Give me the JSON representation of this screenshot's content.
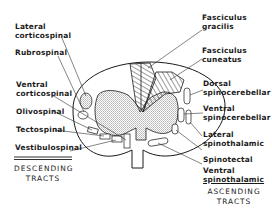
{
  "diagram": {
    "type": "spinal-cord-cross-section",
    "descending": {
      "heading_line1": "DESCENDING",
      "heading_line2": "TRACTS",
      "labels": [
        {
          "line1": "Lateral",
          "line2": "corticospinal"
        },
        {
          "line1": "Rubrospinal",
          "line2": ""
        },
        {
          "line1": "Ventral",
          "line2": "corticospinal"
        },
        {
          "line1": "Olivospinal",
          "line2": ""
        },
        {
          "line1": "Tectospinal",
          "line2": ""
        },
        {
          "line1": "Vestibulospinal",
          "line2": ""
        }
      ]
    },
    "ascending": {
      "heading_line1": "ASCENDING",
      "heading_line2": "TRACTS",
      "labels": [
        {
          "line1": "Fasciculus",
          "line2": "gracilis"
        },
        {
          "line1": "Fasciculus",
          "line2": "cuneatus"
        },
        {
          "line1": "Dorsal",
          "line2": "spinocerebellar"
        },
        {
          "line1": "Ventral",
          "line2": "spinocerebellar"
        },
        {
          "line1": "Lateral",
          "line2": "spinothalamic"
        },
        {
          "line1": "Spinotectal",
          "line2": ""
        },
        {
          "line1": "Ventral",
          "line2": "spinothalamic"
        }
      ]
    },
    "colors": {
      "ink": "#1a1a1a",
      "background": "#ffffff",
      "stipple": "#9a9a9a"
    }
  }
}
